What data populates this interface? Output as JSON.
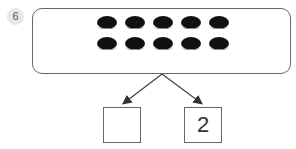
{
  "problem_number": "6",
  "counters": {
    "count": 10,
    "rows": 2,
    "columns": 5,
    "color": "#111111"
  },
  "number_bond": {
    "whole": 10,
    "parts": [
      {
        "position": "left",
        "value": ""
      },
      {
        "position": "right",
        "value": "2"
      }
    ]
  }
}
